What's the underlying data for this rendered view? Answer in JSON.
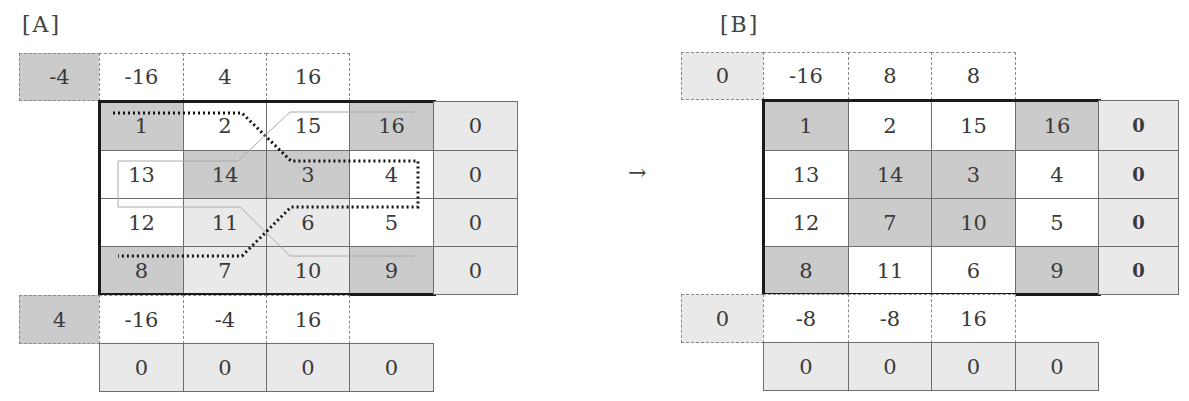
{
  "panels": {
    "A": {
      "label": "[A]",
      "top_left": "-4",
      "top_row": [
        "-16",
        "4",
        "16"
      ],
      "grid": [
        [
          "1",
          "2",
          "15",
          "16"
        ],
        [
          "13",
          "14",
          "3",
          "4"
        ],
        [
          "12",
          "11",
          "6",
          "5"
        ],
        [
          "8",
          "7",
          "10",
          "9"
        ]
      ],
      "right_col": [
        "0",
        "0",
        "0",
        "0"
      ],
      "bottom_left": "4",
      "bottom_row": [
        "-16",
        "-4",
        "16"
      ],
      "zero_row": [
        "0",
        "0",
        "0",
        "0"
      ]
    },
    "B": {
      "label": "[B]",
      "top_left": "0",
      "top_row": [
        "-16",
        "8",
        "8"
      ],
      "grid": [
        [
          "1",
          "2",
          "15",
          "16"
        ],
        [
          "13",
          "14",
          "3",
          "4"
        ],
        [
          "12",
          "7",
          "10",
          "5"
        ],
        [
          "8",
          "11",
          "6",
          "9"
        ]
      ],
      "right_col": [
        "0",
        "0",
        "0",
        "0"
      ],
      "bottom_left": "0",
      "bottom_row": [
        "-8",
        "-8",
        "16"
      ],
      "zero_row": [
        "0",
        "0",
        "0",
        "0"
      ]
    }
  },
  "arrow": "→",
  "colors": {
    "dark": "#cbcbcb",
    "light": "#e9e9e9",
    "white": "#ffffff",
    "border": "#1a1a1a"
  }
}
